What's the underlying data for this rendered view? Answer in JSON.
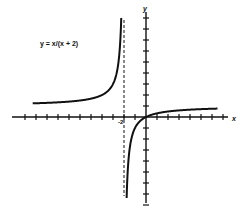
{
  "chart_data": {
    "type": "line",
    "title": "y = x/(x + 2)",
    "xlabel": "x",
    "ylabel": "y",
    "function": "y = x/(x + 2)",
    "vertical_asymptote": -2,
    "horizontal_asymptote": 1,
    "xlim": [
      -12,
      7
    ],
    "ylim": [
      -8,
      9
    ],
    "grid": false,
    "tick_step": 1,
    "tick_labels": [
      {
        "axis": "x",
        "value": -2,
        "label": "-2"
      }
    ],
    "legend": null,
    "series": [
      {
        "name": "left branch (x < -2)",
        "x": [
          -10,
          -8,
          -6,
          -5,
          -4,
          -3,
          -2.5,
          -2.25,
          -2.15
        ],
        "y": [
          1.25,
          1.33,
          1.5,
          1.67,
          2.0,
          3.0,
          5.0,
          9.0,
          14.3
        ]
      },
      {
        "name": "right branch (x > -2)",
        "x": [
          -1.9,
          -1.8,
          -1.6,
          -1.4,
          -1.0,
          -0.5,
          0,
          1,
          2,
          4,
          6.5
        ],
        "y": [
          -19,
          -9,
          -4,
          -2.33,
          -1.0,
          -0.33,
          0,
          0.33,
          0.5,
          0.67,
          0.76
        ]
      }
    ]
  },
  "labels": {
    "equation": "y = x/(x + 2)",
    "x_axis": "x",
    "y_axis": "y",
    "asymptote_tick": "-2"
  }
}
